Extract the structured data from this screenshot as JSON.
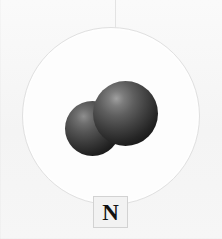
{
  "diagram": {
    "background_color": "#f7f7f7",
    "guide_line": {
      "name": "vertical-guide-line",
      "color": "#e3e3e3"
    },
    "cloud_circle": {
      "name": "atom-boundary-circle",
      "fill_color": "#fdfdfd",
      "border_color": "#e0e0e0"
    },
    "atoms": [
      {
        "name": "atom-sphere-left",
        "element": "N",
        "color": "#3b3b3b",
        "highlight_color": "#8e8e8e"
      },
      {
        "name": "atom-sphere-right",
        "element": "N",
        "color": "#414141",
        "highlight_color": "#a0a0a0"
      }
    ],
    "label": {
      "text": "N",
      "box_fill_color": "#f2f2f2",
      "box_border_color": "#d2d2d2",
      "text_color": "#111111"
    }
  }
}
